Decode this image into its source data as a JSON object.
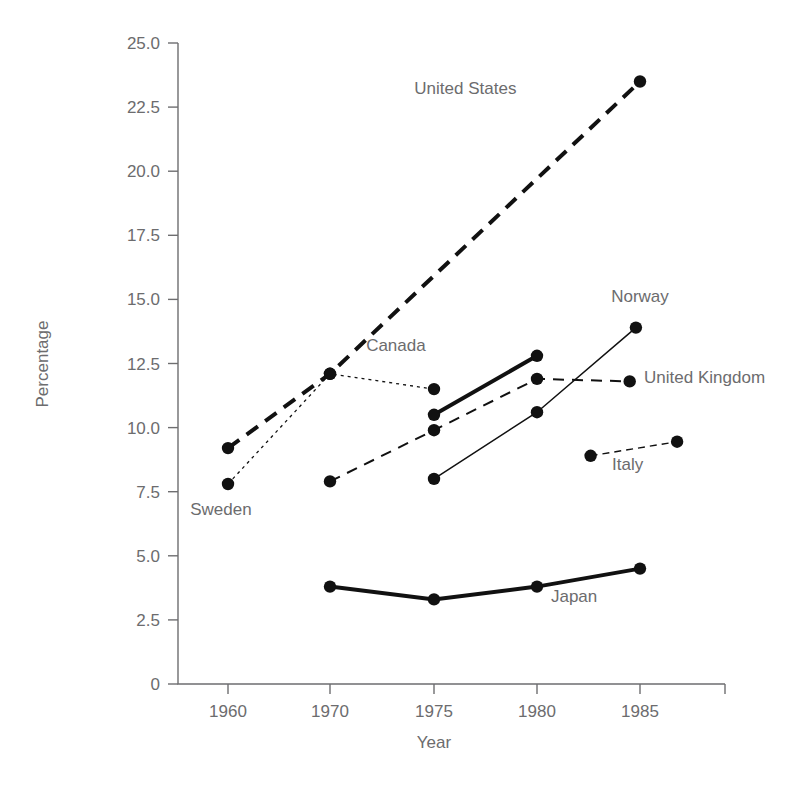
{
  "chart_data": {
    "type": "line",
    "title": "",
    "xlabel": "Year",
    "ylabel": "Percentage",
    "grid": false,
    "legend_position": "inline-labels",
    "xlim": [
      1955,
      1990
    ],
    "ylim": [
      0,
      25
    ],
    "x_ticks": [
      1960,
      1970,
      1975,
      1980,
      1985
    ],
    "x_tick_labels": [
      "1960",
      "1970",
      "1975",
      "1980",
      "1985"
    ],
    "y_ticks": [
      0,
      2.5,
      5.0,
      7.5,
      10.0,
      12.5,
      15.0,
      17.5,
      20.0,
      22.5,
      25.0
    ],
    "y_tick_labels": [
      "0",
      "2.5",
      "5.0",
      "7.5",
      "10.0",
      "12.5",
      "15.0",
      "17.5",
      "20.0",
      "22.5",
      "25.0"
    ],
    "series": [
      {
        "name": "United States",
        "label": "United States",
        "style": "thick-dashed",
        "x": [
          1960,
          1970,
          1985
        ],
        "values": [
          9.2,
          12.1,
          23.5
        ],
        "label_x": 1979.0,
        "label_y": 23.0,
        "label_anchor": "end"
      },
      {
        "name": "Sweden",
        "label": "Sweden",
        "style": "dotted",
        "x": [
          1960,
          1970,
          1975
        ],
        "values": [
          7.8,
          12.1,
          11.5
        ],
        "label_x": 1959.3,
        "label_y": 6.6,
        "label_anchor": "middle"
      },
      {
        "name": "Canada",
        "label": "Canada",
        "style": "thick-solid",
        "x": [
          1975,
          1980
        ],
        "values": [
          10.5,
          12.8
        ],
        "label_x": 1974.6,
        "label_y": 13.0,
        "label_anchor": "end"
      },
      {
        "name": "United Kingdom",
        "label": "United Kingdom",
        "style": "dashed",
        "x": [
          1970,
          1975,
          1980,
          1984.5
        ],
        "values": [
          7.9,
          9.9,
          11.9,
          11.8
        ],
        "label_x": 1985.2,
        "label_y": 11.75,
        "label_anchor": "start"
      },
      {
        "name": "Norway",
        "label": "Norway",
        "style": "thin-solid",
        "x": [
          1975,
          1980,
          1984.8
        ],
        "values": [
          8.0,
          10.6,
          13.9
        ],
        "label_x": 1985.0,
        "label_y": 14.9,
        "label_anchor": "middle"
      },
      {
        "name": "Japan",
        "label": "Japan",
        "style": "thick-solid",
        "x": [
          1970,
          1975,
          1980,
          1985
        ],
        "values": [
          3.8,
          3.3,
          3.8,
          4.5
        ],
        "label_x": 1981.8,
        "label_y": 3.2,
        "label_anchor": "middle"
      },
      {
        "name": "Italy",
        "label": "Italy",
        "style": "fine-dashed",
        "x": [
          1982.6,
          1986.8
        ],
        "values": [
          8.9,
          9.45
        ],
        "label_x": 1984.4,
        "label_y": 8.35,
        "label_anchor": "middle"
      }
    ]
  }
}
